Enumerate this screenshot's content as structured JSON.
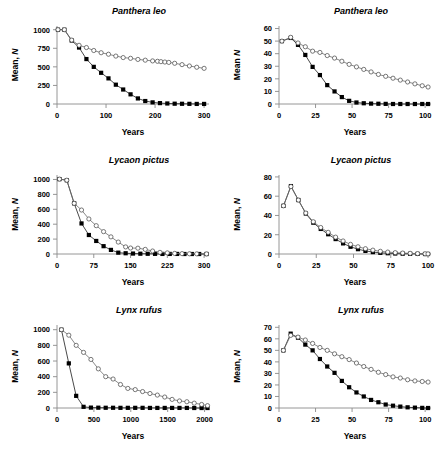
{
  "figure": {
    "title": "",
    "axis_labels": {
      "x": "Years",
      "y_prefix": "Mean, ",
      "y_italic": "N"
    },
    "series_names": [
      "filled-squares",
      "open-circles"
    ]
  },
  "chart_data": [
    {
      "id": "panthera-leo-300",
      "type": "line",
      "title": "Panthera leo",
      "xlabel": "Years",
      "ylabel": "Mean, N",
      "grid": false,
      "legend": "none",
      "xlim": [
        0,
        310
      ],
      "ylim": [
        0,
        1050
      ],
      "xticks": [
        0,
        100,
        200,
        300
      ],
      "yticks": [
        0,
        250,
        500,
        750,
        1000
      ],
      "series": [
        {
          "name": "filled-squares",
          "marker": "filled-square",
          "x": [
            2,
            15,
            30,
            45,
            60,
            75,
            90,
            105,
            120,
            135,
            150,
            165,
            180,
            195,
            210,
            225,
            240,
            255,
            270,
            285,
            300
          ],
          "values": [
            1000,
            1000,
            855,
            760,
            605,
            500,
            420,
            345,
            260,
            195,
            130,
            75,
            40,
            22,
            12,
            7,
            4,
            3,
            2,
            1,
            1
          ]
        },
        {
          "name": "open-circles",
          "marker": "open-circle",
          "x": [
            2,
            15,
            30,
            45,
            60,
            75,
            90,
            105,
            120,
            135,
            150,
            165,
            180,
            195,
            205,
            212,
            220,
            228,
            240,
            255,
            270,
            285,
            300
          ],
          "values": [
            1000,
            1000,
            860,
            790,
            760,
            720,
            690,
            670,
            645,
            625,
            615,
            600,
            590,
            580,
            575,
            570,
            565,
            560,
            548,
            530,
            512,
            495,
            480
          ]
        }
      ]
    },
    {
      "id": "panthera-leo-100",
      "type": "line",
      "title": "Panthera leo",
      "xlabel": "Years",
      "ylabel": "Mean  N",
      "grid": false,
      "legend": "none",
      "xlim": [
        0,
        104
      ],
      "ylim": [
        0,
        62
      ],
      "xticks": [
        0,
        25,
        50,
        75,
        100
      ],
      "yticks": [
        0,
        10,
        20,
        30,
        40,
        50,
        60
      ],
      "series": [
        {
          "name": "filled-squares",
          "marker": "filled-square",
          "x": [
            2,
            8,
            13,
            18,
            23,
            28,
            33,
            38,
            43,
            48,
            53,
            58,
            63,
            68,
            73,
            78,
            83,
            88,
            93,
            98,
            102
          ],
          "values": [
            50,
            52.5,
            47,
            39,
            29.5,
            23,
            15,
            10,
            5.5,
            2.5,
            1.2,
            0.6,
            0.3,
            0.2,
            0.1,
            0,
            0,
            0,
            0,
            0,
            0
          ]
        },
        {
          "name": "open-circles",
          "marker": "open-circle",
          "x": [
            2,
            8,
            13,
            18,
            23,
            28,
            33,
            38,
            43,
            48,
            53,
            58,
            63,
            68,
            73,
            78,
            83,
            88,
            93,
            98,
            102
          ],
          "values": [
            50,
            53,
            48.5,
            45.5,
            42,
            41,
            38.5,
            36.5,
            34,
            31.5,
            29.5,
            27.5,
            25.5,
            23.5,
            22,
            20.5,
            19,
            17.5,
            16,
            14.5,
            13.5
          ]
        }
      ]
    },
    {
      "id": "lycaon-pictus-300",
      "type": "line",
      "title": "Lycaon pictus",
      "xlabel": "Years",
      "ylabel": "Mean, N",
      "grid": false,
      "legend": "none",
      "xlim": [
        0,
        310
      ],
      "ylim": [
        0,
        1060
      ],
      "xticks": [
        0,
        75,
        150,
        225,
        300
      ],
      "yticks": [
        0,
        200,
        400,
        600,
        800,
        1000
      ],
      "series": [
        {
          "name": "filled-squares",
          "marker": "filled-square",
          "x": [
            5,
            20,
            35,
            50,
            65,
            80,
            95,
            110,
            125,
            140,
            155,
            170,
            185,
            200,
            215,
            230,
            245,
            260,
            275,
            290,
            305
          ],
          "values": [
            1005,
            990,
            680,
            410,
            255,
            175,
            105,
            55,
            18,
            10,
            6,
            4,
            3,
            2,
            1,
            1,
            1,
            0,
            0,
            0,
            0
          ]
        },
        {
          "name": "open-circles",
          "marker": "open-circle",
          "x": [
            5,
            20,
            35,
            50,
            65,
            80,
            95,
            110,
            125,
            140,
            150,
            165,
            180,
            195,
            210,
            225,
            240,
            255,
            270,
            285,
            305
          ],
          "values": [
            1005,
            990,
            680,
            590,
            470,
            380,
            300,
            230,
            160,
            95,
            80,
            78,
            62,
            40,
            22,
            15,
            8,
            5,
            3,
            2,
            1
          ]
        }
      ]
    },
    {
      "id": "lycaon-pictus-100",
      "type": "line",
      "title": "Lycaon pictus",
      "xlabel": "Years",
      "ylabel": "Mean, N",
      "grid": false,
      "legend": "none",
      "xlim": [
        0,
        102
      ],
      "ylim": [
        0,
        82
      ],
      "xticks": [
        0,
        25,
        50,
        75,
        100
      ],
      "yticks": [
        0,
        20,
        40,
        60,
        80
      ],
      "series": [
        {
          "name": "filled-squares",
          "marker": "filled-square",
          "x": [
            3,
            8,
            13,
            18,
            23,
            28,
            33,
            38,
            43,
            48,
            53,
            58,
            63,
            68,
            73,
            78,
            83,
            88,
            93,
            98,
            100
          ],
          "values": [
            50,
            70.5,
            56,
            42,
            32.5,
            26,
            20.5,
            15.5,
            11,
            7.5,
            5,
            3.2,
            2,
            1.2,
            0.8,
            0.5,
            0.3,
            0.2,
            0.1,
            0,
            0
          ]
        },
        {
          "name": "open-circles",
          "marker": "open-circle",
          "x": [
            3,
            8,
            13,
            18,
            23,
            28,
            33,
            38,
            43,
            48,
            53,
            58,
            63,
            68,
            73,
            78,
            83,
            88,
            93,
            98,
            100
          ],
          "values": [
            50,
            70,
            56,
            42.5,
            33.5,
            27.5,
            22.5,
            17.5,
            13.5,
            10,
            7.5,
            5.5,
            4,
            2.8,
            2,
            1.4,
            1,
            0.7,
            0.4,
            0.2,
            0.1
          ]
        }
      ]
    },
    {
      "id": "lynx-rufus-2000",
      "type": "line",
      "title": "Lynx rufus",
      "xlabel": "Years",
      "ylabel": "Mean, N",
      "grid": false,
      "legend": "none",
      "xlim": [
        0,
        2060
      ],
      "ylim": [
        0,
        1060
      ],
      "xticks": [
        0,
        500,
        1000,
        1500,
        2000
      ],
      "yticks": [
        0,
        200,
        400,
        600,
        800,
        1000
      ],
      "series": [
        {
          "name": "filled-squares",
          "marker": "filled-square",
          "x": [
            60,
            160,
            260,
            360,
            460,
            560,
            660,
            760,
            860,
            960,
            1060,
            1160,
            1260,
            1360,
            1460,
            1560,
            1660,
            1760,
            1860,
            1960,
            2040
          ],
          "values": [
            1000,
            570,
            155,
            15,
            5,
            4,
            3,
            3,
            2,
            2,
            2,
            2,
            1,
            1,
            1,
            1,
            1,
            1,
            0,
            0,
            0
          ]
        },
        {
          "name": "open-circles",
          "marker": "open-circle",
          "x": [
            60,
            160,
            260,
            360,
            460,
            560,
            660,
            760,
            860,
            960,
            1060,
            1160,
            1260,
            1360,
            1460,
            1560,
            1660,
            1760,
            1860,
            1960,
            2040
          ],
          "values": [
            1000,
            930,
            800,
            710,
            620,
            500,
            400,
            370,
            300,
            250,
            235,
            210,
            185,
            165,
            140,
            110,
            90,
            80,
            62,
            45,
            30
          ]
        }
      ]
    },
    {
      "id": "lynx-rufus-100",
      "type": "line",
      "title": "Lynx rufus",
      "xlabel": "Years",
      "ylabel": "Mean, N",
      "grid": false,
      "legend": "none",
      "xlim": [
        0,
        104
      ],
      "ylim": [
        0,
        72
      ],
      "xticks": [
        0,
        25,
        50,
        75,
        100
      ],
      "yticks": [
        0,
        10,
        20,
        30,
        40,
        50,
        60,
        70
      ],
      "series": [
        {
          "name": "filled-squares",
          "marker": "filled-square",
          "x": [
            3,
            8,
            13,
            18,
            23,
            28,
            33,
            38,
            43,
            48,
            53,
            58,
            63,
            68,
            73,
            78,
            83,
            88,
            93,
            98,
            102
          ],
          "values": [
            50,
            64.5,
            61,
            55,
            50,
            42.5,
            36,
            30.5,
            23.5,
            18,
            13.5,
            10,
            7,
            5,
            3,
            2,
            1.2,
            0.6,
            0.3,
            0.1,
            0
          ]
        },
        {
          "name": "open-circles",
          "marker": "open-circle",
          "x": [
            3,
            8,
            13,
            18,
            23,
            28,
            33,
            38,
            43,
            48,
            53,
            58,
            63,
            68,
            73,
            78,
            83,
            88,
            93,
            98,
            102
          ],
          "values": [
            50,
            63,
            61.5,
            59,
            56,
            52.5,
            50,
            47,
            44.5,
            42,
            39,
            36,
            33.5,
            31,
            29,
            27,
            26,
            24.5,
            23.5,
            23,
            22.5
          ]
        }
      ]
    }
  ]
}
